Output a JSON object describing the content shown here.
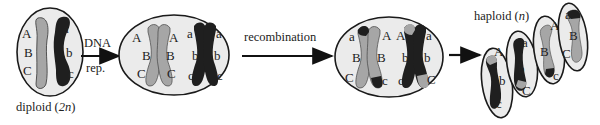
{
  "diagram": {
    "colors": {
      "cell_fill": "#ebebeb",
      "cell_stroke": "#1a1a1a",
      "light_chromosome": "#a6a6a6",
      "dark_chromosome": "#1f1f1f",
      "arrow": "#111111"
    },
    "stages": {
      "diploid": {
        "caption_main": "diploid (",
        "caption_n": "2n",
        "caption_end": ")",
        "light_genes": [
          "A",
          "B",
          "C"
        ],
        "dark_genes": [
          "a",
          "b",
          "c"
        ]
      },
      "replicated": {
        "light_left_genes": [
          "A",
          "B",
          "C"
        ],
        "light_right_genes": [
          "A",
          "B",
          "C"
        ],
        "dark_left_genes": [
          "a",
          "b",
          "c"
        ],
        "dark_right_genes": [
          "a",
          "b",
          "c"
        ]
      },
      "recombined": {
        "light_left_genes": [
          "a",
          "B",
          "C"
        ],
        "light_right_genes": [
          "A",
          "B",
          "c"
        ],
        "dark_left_genes": [
          "A",
          "b",
          "c"
        ],
        "dark_right_genes": [
          "a",
          "b",
          "C"
        ]
      },
      "haploid": {
        "caption_main": "haploid (",
        "caption_n": "n",
        "caption_end": ")",
        "cells": [
          {
            "genes": [
              "A",
              "b",
              "c"
            ]
          },
          {
            "genes": [
              "a",
              "b",
              "C"
            ]
          },
          {
            "genes": [
              "A",
              "B",
              "c"
            ]
          },
          {
            "genes": [
              "a",
              "B",
              "C"
            ]
          }
        ]
      }
    },
    "arrows": {
      "dna_rep_top": "DNA",
      "dna_rep_bottom": "rep.",
      "recombination": "recombination"
    }
  }
}
